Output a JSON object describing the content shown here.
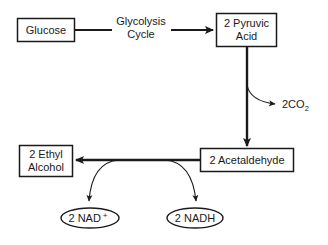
{
  "diagram": {
    "type": "flowchart",
    "nodes": {
      "glucose": {
        "label": "Glucose",
        "shape": "rectangle"
      },
      "pyruvic_acid": {
        "line1": "2 Pyruvic",
        "line2": "Acid",
        "shape": "rectangle"
      },
      "acetaldehyde": {
        "label": "2 Acetaldehyde",
        "shape": "rectangle"
      },
      "ethyl_alcohol": {
        "line1": "2 Ethyl",
        "line2": "Alcohol",
        "shape": "rectangle"
      },
      "nad_plus": {
        "label": "2 NAD",
        "superscript": "+",
        "shape": "ellipse"
      },
      "nadh": {
        "label": "2 NADH",
        "shape": "ellipse"
      }
    },
    "edge_labels": {
      "glycolysis": {
        "line1": "Glycolysis",
        "line2": "Cycle"
      },
      "co2": {
        "main": "2CO",
        "subscript": "2"
      }
    },
    "edges": [
      {
        "from": "Glucose",
        "to": "2 Pyruvic Acid",
        "label": "Glycolysis Cycle"
      },
      {
        "from": "2 Pyruvic Acid",
        "to": "2 Acetaldehyde",
        "branch_output": "2CO2"
      },
      {
        "from": "2 Acetaldehyde",
        "to": "2 Ethyl Alcohol",
        "side_branches": [
          "2 NAD+",
          "2 NADH"
        ]
      }
    ],
    "colors": {
      "ink": "#1a1a1a",
      "background": "#ffffff"
    }
  }
}
